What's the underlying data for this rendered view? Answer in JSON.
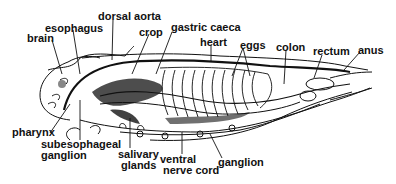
{
  "diagram": {
    "labels": [
      {
        "id": "brain",
        "text": "brain",
        "x": 27,
        "y": 33
      },
      {
        "id": "esophagus",
        "text": "esophagus",
        "x": 45,
        "y": 23
      },
      {
        "id": "dorsal-aorta",
        "text": "dorsal aorta",
        "x": 98,
        "y": 11
      },
      {
        "id": "crop",
        "text": "crop",
        "x": 139,
        "y": 27
      },
      {
        "id": "gastric-caeca",
        "text": "gastric caeca",
        "x": 171,
        "y": 22
      },
      {
        "id": "heart",
        "text": "heart",
        "x": 200,
        "y": 37
      },
      {
        "id": "eggs",
        "text": "eggs",
        "x": 240,
        "y": 40
      },
      {
        "id": "colon",
        "text": "colon",
        "x": 276,
        "y": 42
      },
      {
        "id": "rectum",
        "text": "rectum",
        "x": 313,
        "y": 46
      },
      {
        "id": "anus",
        "text": "anus",
        "x": 358,
        "y": 45
      },
      {
        "id": "pharynx",
        "text": "pharynx",
        "x": 12,
        "y": 131
      },
      {
        "id": "subesophageal-ganglion-1",
        "text": "subesophageal",
        "x": 41,
        "y": 141
      },
      {
        "id": "subesophageal-ganglion-2",
        "text": "ganglion",
        "x": 41,
        "y": 152
      },
      {
        "id": "salivary-glands-1",
        "text": "salivary",
        "x": 118,
        "y": 150
      },
      {
        "id": "salivary-glands-2",
        "text": "glands",
        "x": 121,
        "y": 161
      },
      {
        "id": "ventral-nerve-cord-1",
        "text": "ventral",
        "x": 160,
        "y": 155
      },
      {
        "id": "ventral-nerve-cord-2",
        "text": "nerve cord",
        "x": 163,
        "y": 166
      },
      {
        "id": "ganglion",
        "text": "ganglion",
        "x": 218,
        "y": 158
      }
    ]
  }
}
